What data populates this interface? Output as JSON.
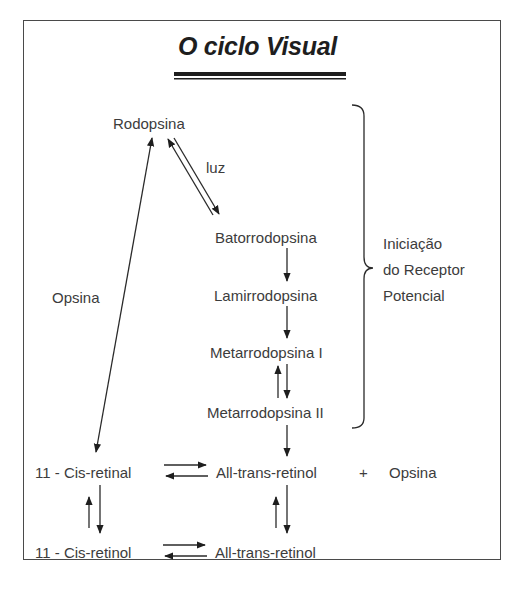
{
  "title": "O ciclo Visual",
  "nodes": {
    "rodopsina": "Rodopsina",
    "luz": "luz",
    "batorrodopsina": "Batorrodopsina",
    "lamirrodopsina": "Lamirrodopsina",
    "metarrodopsina_1": "Metarrodopsina I",
    "metarrodopsina_2": "Metarrodopsina II",
    "opsina_side": "Opsina",
    "cis_retinal": "11 - Cis-retinal",
    "all_trans_retinal": "All-trans-retinol",
    "plus": "+",
    "opsina_product": "Opsina",
    "cis_retinol": "11 - Cis-retinol",
    "all_trans_retinol": "All-trans-retinol"
  },
  "brace_label": {
    "line1": "Iniciação",
    "line2": "do Receptor",
    "line3": "Potencial"
  },
  "colors": {
    "line": "#2a2a2a",
    "text": "#3c3c3c",
    "title": "#1e1e1e"
  }
}
